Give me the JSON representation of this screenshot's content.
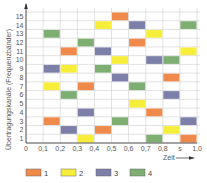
{
  "chart_data": {
    "type": "heatmap",
    "title": "",
    "xlabel": "Zeit",
    "ylabel": "Übertragungskanäle (Frequenzbänder)",
    "x_tick_labels": [
      "0",
      "0,1",
      "0,2",
      "0,3",
      "0,4",
      "0,5",
      "0,6",
      "0,7",
      "0,8",
      "s",
      "1,0"
    ],
    "y_tick_labels": [
      "1",
      "2",
      "3",
      "4",
      "5",
      "6",
      "7",
      "8",
      "9",
      "10",
      "11",
      "12",
      "13",
      "14",
      "15"
    ],
    "xlim": [
      0,
      1.0
    ],
    "ylim": [
      0,
      15
    ],
    "grid": true,
    "legend_position": "bottom",
    "series": [
      {
        "name": "1",
        "color": "#F08A4B"
      },
      {
        "name": "2",
        "color": "#F7EE3A"
      },
      {
        "name": "3",
        "color": "#7C7FA8"
      },
      {
        "name": "4",
        "color": "#7FAE73"
      }
    ],
    "blocks": [
      {
        "channel": 15,
        "t_start": 0.5,
        "t_end": 0.6,
        "series": "1"
      },
      {
        "channel": 14,
        "t_start": 0.4,
        "t_end": 0.5,
        "series": "2"
      },
      {
        "channel": 14,
        "t_start": 0.6,
        "t_end": 0.7,
        "series": "3"
      },
      {
        "channel": 14,
        "t_start": 0.9,
        "t_end": 1.0,
        "series": "4"
      },
      {
        "channel": 13,
        "t_start": 0.1,
        "t_end": 0.2,
        "series": "4"
      },
      {
        "channel": 13,
        "t_start": 0.7,
        "t_end": 0.8,
        "series": "2"
      },
      {
        "channel": 12,
        "t_start": 0.3,
        "t_end": 0.4,
        "series": "4"
      },
      {
        "channel": 12,
        "t_start": 0.6,
        "t_end": 0.7,
        "series": "1"
      },
      {
        "channel": 11,
        "t_start": 0.2,
        "t_end": 0.3,
        "series": "1"
      },
      {
        "channel": 11,
        "t_start": 0.4,
        "t_end": 0.5,
        "series": "3"
      },
      {
        "channel": 11,
        "t_start": 0.9,
        "t_end": 1.0,
        "series": "2"
      },
      {
        "channel": 10,
        "t_start": 0.5,
        "t_end": 0.6,
        "series": "2"
      },
      {
        "channel": 10,
        "t_start": 0.7,
        "t_end": 0.8,
        "series": "3"
      },
      {
        "channel": 10,
        "t_start": 0.8,
        "t_end": 0.9,
        "series": "4"
      },
      {
        "channel": 9,
        "t_start": 0.1,
        "t_end": 0.2,
        "series": "3"
      },
      {
        "channel": 9,
        "t_start": 0.2,
        "t_end": 0.3,
        "series": "2"
      },
      {
        "channel": 9,
        "t_start": 0.4,
        "t_end": 0.5,
        "series": "4"
      },
      {
        "channel": 8,
        "t_start": 0.5,
        "t_end": 0.6,
        "series": "3"
      },
      {
        "channel": 8,
        "t_start": 0.8,
        "t_end": 0.9,
        "series": "1"
      },
      {
        "channel": 7,
        "t_start": 0.1,
        "t_end": 0.2,
        "series": "2"
      },
      {
        "channel": 7,
        "t_start": 0.3,
        "t_end": 0.4,
        "series": "1"
      },
      {
        "channel": 7,
        "t_start": 0.6,
        "t_end": 0.7,
        "series": "4"
      },
      {
        "channel": 6,
        "t_start": 0.2,
        "t_end": 0.3,
        "series": "4"
      },
      {
        "channel": 6,
        "t_start": 0.8,
        "t_end": 0.9,
        "series": "3"
      },
      {
        "channel": 5,
        "t_start": 0.6,
        "t_end": 0.7,
        "series": "2"
      },
      {
        "channel": 4,
        "t_start": 0.3,
        "t_end": 0.4,
        "series": "3"
      },
      {
        "channel": 4,
        "t_start": 0.7,
        "t_end": 0.8,
        "series": "1"
      },
      {
        "channel": 3,
        "t_start": 0.1,
        "t_end": 0.2,
        "series": "1"
      },
      {
        "channel": 3,
        "t_start": 0.5,
        "t_end": 0.6,
        "series": "4"
      },
      {
        "channel": 3,
        "t_start": 0.9,
        "t_end": 1.0,
        "series": "3"
      },
      {
        "channel": 2,
        "t_start": 0.2,
        "t_end": 0.3,
        "series": "3"
      },
      {
        "channel": 2,
        "t_start": 0.4,
        "t_end": 0.5,
        "series": "1"
      },
      {
        "channel": 2,
        "t_start": 0.8,
        "t_end": 0.9,
        "series": "2"
      },
      {
        "channel": 1,
        "t_start": 0.3,
        "t_end": 0.4,
        "series": "2"
      },
      {
        "channel": 1,
        "t_start": 0.7,
        "t_end": 0.8,
        "series": "4"
      },
      {
        "channel": 1,
        "t_start": 0.9,
        "t_end": 1.0,
        "series": "1"
      }
    ]
  }
}
